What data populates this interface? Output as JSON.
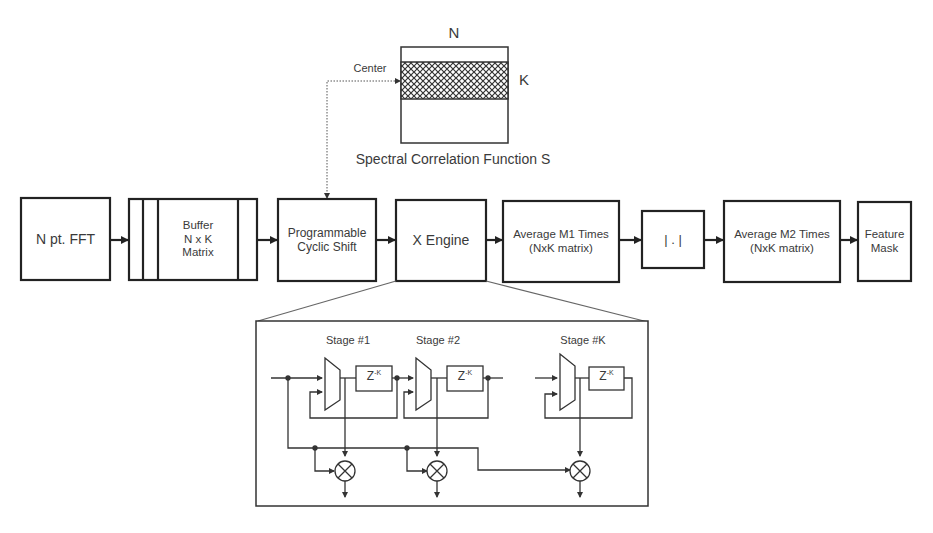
{
  "spectral_matrix": {
    "label_n": "N",
    "label_k": "K",
    "label_center": "Center",
    "caption": "Spectral Correlation Function S"
  },
  "pipeline": {
    "blocks": [
      {
        "id": "fft",
        "lines": [
          "N pt. FFT"
        ]
      },
      {
        "id": "buffer",
        "lines": [
          "Buffer",
          "N x K",
          "Matrix"
        ]
      },
      {
        "id": "cyclic_shift",
        "lines": [
          "Programmable",
          "Cyclic Shift"
        ]
      },
      {
        "id": "x_engine",
        "lines": [
          "X Engine"
        ]
      },
      {
        "id": "avg_m1",
        "lines": [
          "Average M1 Times",
          "(NxK matrix)"
        ]
      },
      {
        "id": "abs",
        "lines": [
          "| . |"
        ]
      },
      {
        "id": "avg_m2",
        "lines": [
          "Average M2 Times",
          "(NxK matrix)"
        ]
      },
      {
        "id": "feature_mask",
        "lines": [
          "Feature",
          "Mask"
        ]
      }
    ]
  },
  "x_engine_detail": {
    "stages": [
      {
        "label": "Stage #1",
        "delay": "Z",
        "delay_exp": "-K"
      },
      {
        "label": "Stage #2",
        "delay": "Z",
        "delay_exp": "-K"
      },
      {
        "label": "Stage #K",
        "delay": "Z",
        "delay_exp": "-K"
      }
    ]
  }
}
